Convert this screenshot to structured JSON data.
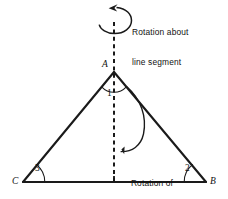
{
  "figure": {
    "kind": "geometry-diagram",
    "background_color": "#ffffff",
    "ink_color": "#1a1a1a"
  },
  "vertices": {
    "apex": {
      "label": "A",
      "x": 114,
      "y": 72
    },
    "right": {
      "label": "B",
      "x": 206,
      "y": 182
    },
    "left": {
      "label": "C",
      "x": 23,
      "y": 182
    }
  },
  "angles": [
    {
      "name": "angle-at-apex",
      "label": "1",
      "vertex": "A"
    },
    {
      "name": "angle-at-right",
      "label": "2",
      "vertex": "B"
    },
    {
      "name": "angle-at-left",
      "label": "3",
      "vertex": "C"
    }
  ],
  "axis": {
    "name": "line-segment-of-symmetry",
    "style": "dashed",
    "x": 114,
    "y_top": 22,
    "y_bottom": 182
  },
  "annotations": {
    "axis_rotation": {
      "line1": "Rotation about",
      "line2": "line segment",
      "arrow": "counterclockwise-loop"
    },
    "triangle_rotation": {
      "line1": "Rotation of",
      "line2": "triangle",
      "arrow": "curved-down-left"
    }
  }
}
